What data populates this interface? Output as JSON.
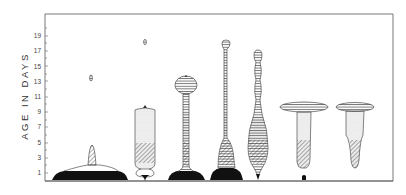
{
  "chart_data": {
    "type": "diagram",
    "title": "",
    "ylabel": "AGE IN DAYS",
    "xlabel": "",
    "ylim": [
      0,
      21
    ],
    "yticks": [
      1,
      3,
      5,
      7,
      9,
      11,
      13,
      15,
      17,
      19
    ],
    "legend": [],
    "fill_styles": [
      "solid-black",
      "diagonal-hatch",
      "stipple",
      "horizontal-lines"
    ],
    "profiles": [
      {
        "index": 1,
        "top_day": 5,
        "isolated_marker_day": 13.5
      },
      {
        "index": 2,
        "top_day": 10,
        "isolated_marker_day": 18.5
      },
      {
        "index": 3,
        "top_day": 14
      },
      {
        "index": 4,
        "top_day": 18
      },
      {
        "index": 5,
        "top_day": 17
      },
      {
        "index": 6,
        "top_day": 10
      },
      {
        "index": 7,
        "top_day": 10
      }
    ]
  },
  "axis": {
    "label": "AGE IN DAYS",
    "ticks": [
      "1",
      "3",
      "5",
      "7",
      "9",
      "11",
      "13",
      "15",
      "17",
      "19"
    ]
  }
}
